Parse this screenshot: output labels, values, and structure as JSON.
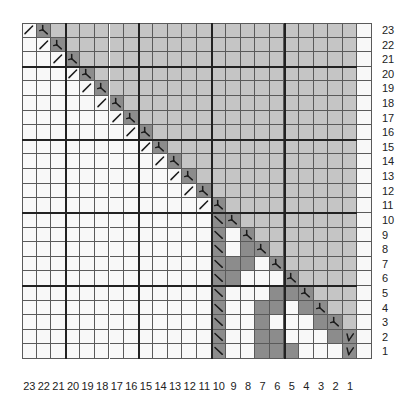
{
  "chart_data": {
    "type": "heatmap",
    "title": "",
    "rows": 23,
    "cols": 24,
    "row_labels": [
      "23",
      "22",
      "21",
      "20",
      "19",
      "18",
      "17",
      "16",
      "15",
      "14",
      "13",
      "12",
      "11",
      "10",
      "9",
      "8",
      "7",
      "6",
      "5",
      "4",
      "3",
      "2",
      "1"
    ],
    "col_labels": [
      "23",
      "22",
      "21",
      "20",
      "19",
      "18",
      "17",
      "16",
      "15",
      "14",
      "13",
      "12",
      "11",
      "10",
      "9",
      "8",
      "7",
      "6",
      "5",
      "4",
      "3",
      "2",
      "1",
      ""
    ],
    "colors": {
      "W": "#f8f8f8",
      "L": "#c5c5c5",
      "D": "#8c8c8c",
      "grid": "#5a5a5a",
      "thick": "#222222",
      "symbol": "#1a1a1a"
    },
    "legend": {
      "W": "white cell",
      "L": "light gray cell",
      "D": "dark gray cell",
      "/": "slash symbol",
      "\\": "backslash symbol",
      "Y": "inverted-Y (left-leaning decrease) symbol",
      "V": "V symbol"
    },
    "thick_lines": {
      "horizontal_after_row_index": [
        2,
        7,
        12,
        17
      ],
      "vertical_after_col_index": [
        2,
        7,
        12,
        17
      ]
    },
    "grid": [
      [
        "/",
        "Y",
        "L",
        "L",
        "L",
        "L",
        "L",
        "L",
        "L",
        "L",
        "L",
        "L",
        "L",
        "L",
        "L",
        "L",
        "L",
        "L",
        "L",
        "L",
        "L",
        "L",
        "L",
        "W"
      ],
      [
        "W",
        "/",
        "Y",
        "L",
        "L",
        "L",
        "L",
        "L",
        "L",
        "L",
        "L",
        "L",
        "L",
        "L",
        "L",
        "L",
        "L",
        "L",
        "L",
        "L",
        "L",
        "L",
        "L",
        "W"
      ],
      [
        "W",
        "W",
        "/",
        "Y",
        "L",
        "L",
        "L",
        "L",
        "L",
        "L",
        "L",
        "L",
        "L",
        "L",
        "L",
        "L",
        "L",
        "L",
        "L",
        "L",
        "L",
        "L",
        "L",
        "W"
      ],
      [
        "W",
        "W",
        "W",
        "/",
        "Y",
        "L",
        "L",
        "L",
        "L",
        "L",
        "L",
        "L",
        "L",
        "L",
        "L",
        "L",
        "L",
        "L",
        "L",
        "L",
        "L",
        "L",
        "L",
        "W"
      ],
      [
        "W",
        "W",
        "W",
        "W",
        "/",
        "Y",
        "L",
        "L",
        "L",
        "L",
        "L",
        "L",
        "L",
        "L",
        "L",
        "L",
        "L",
        "L",
        "L",
        "L",
        "L",
        "L",
        "L",
        "W"
      ],
      [
        "W",
        "W",
        "W",
        "W",
        "W",
        "/",
        "Y",
        "L",
        "L",
        "L",
        "L",
        "L",
        "L",
        "L",
        "L",
        "L",
        "L",
        "L",
        "L",
        "L",
        "L",
        "L",
        "L",
        "W"
      ],
      [
        "W",
        "W",
        "W",
        "W",
        "W",
        "W",
        "/",
        "Y",
        "L",
        "L",
        "L",
        "L",
        "L",
        "L",
        "L",
        "L",
        "L",
        "L",
        "L",
        "L",
        "L",
        "L",
        "L",
        "W"
      ],
      [
        "W",
        "W",
        "W",
        "W",
        "W",
        "W",
        "W",
        "/",
        "Y",
        "L",
        "L",
        "L",
        "L",
        "L",
        "L",
        "L",
        "L",
        "L",
        "L",
        "L",
        "L",
        "L",
        "L",
        "W"
      ],
      [
        "W",
        "W",
        "W",
        "W",
        "W",
        "W",
        "W",
        "W",
        "/",
        "Y",
        "L",
        "L",
        "L",
        "L",
        "L",
        "L",
        "L",
        "L",
        "L",
        "L",
        "L",
        "L",
        "L",
        "W"
      ],
      [
        "W",
        "W",
        "W",
        "W",
        "W",
        "W",
        "W",
        "W",
        "W",
        "/",
        "Y",
        "L",
        "L",
        "L",
        "L",
        "L",
        "L",
        "L",
        "L",
        "L",
        "L",
        "L",
        "L",
        "W"
      ],
      [
        "W",
        "W",
        "W",
        "W",
        "W",
        "W",
        "W",
        "W",
        "W",
        "W",
        "/",
        "Y",
        "L",
        "L",
        "L",
        "L",
        "L",
        "L",
        "L",
        "L",
        "L",
        "L",
        "L",
        "W"
      ],
      [
        "W",
        "W",
        "W",
        "W",
        "W",
        "W",
        "W",
        "W",
        "W",
        "W",
        "W",
        "/",
        "Y",
        "L",
        "L",
        "L",
        "L",
        "L",
        "L",
        "L",
        "L",
        "L",
        "L",
        "W"
      ],
      [
        "W",
        "W",
        "W",
        "W",
        "W",
        "W",
        "W",
        "W",
        "W",
        "W",
        "W",
        "W",
        "/",
        "Y",
        "L",
        "L",
        "L",
        "L",
        "L",
        "L",
        "L",
        "L",
        "L",
        "W"
      ],
      [
        "W",
        "W",
        "W",
        "W",
        "W",
        "W",
        "W",
        "W",
        "W",
        "W",
        "W",
        "W",
        "W",
        "\\",
        "Y",
        "L",
        "L",
        "L",
        "L",
        "L",
        "L",
        "L",
        "L",
        "W"
      ],
      [
        "W",
        "W",
        "W",
        "W",
        "W",
        "W",
        "W",
        "W",
        "W",
        "W",
        "W",
        "W",
        "W",
        "\\",
        "W",
        "Y",
        "L",
        "L",
        "L",
        "L",
        "L",
        "L",
        "L",
        "W"
      ],
      [
        "W",
        "W",
        "W",
        "W",
        "W",
        "W",
        "W",
        "W",
        "W",
        "W",
        "W",
        "W",
        "W",
        "\\",
        "W",
        "D",
        "Y",
        "L",
        "L",
        "L",
        "L",
        "L",
        "L",
        "W"
      ],
      [
        "W",
        "W",
        "W",
        "W",
        "W",
        "W",
        "W",
        "W",
        "W",
        "W",
        "W",
        "W",
        "W",
        "\\",
        "D",
        "D",
        "W",
        "Y",
        "L",
        "L",
        "L",
        "L",
        "L",
        "W"
      ],
      [
        "W",
        "W",
        "W",
        "W",
        "W",
        "W",
        "W",
        "W",
        "W",
        "W",
        "W",
        "W",
        "W",
        "\\",
        "D",
        "W",
        "W",
        "W",
        "Y",
        "L",
        "L",
        "L",
        "L",
        "W"
      ],
      [
        "W",
        "W",
        "W",
        "W",
        "W",
        "W",
        "W",
        "W",
        "W",
        "W",
        "W",
        "W",
        "W",
        "\\",
        "W",
        "W",
        "W",
        "D",
        "D",
        "Y",
        "L",
        "L",
        "L",
        "W"
      ],
      [
        "W",
        "W",
        "W",
        "W",
        "W",
        "W",
        "W",
        "W",
        "W",
        "W",
        "W",
        "W",
        "W",
        "\\",
        "W",
        "W",
        "D",
        "D",
        "W",
        "D",
        "Y",
        "L",
        "L",
        "W"
      ],
      [
        "W",
        "W",
        "W",
        "W",
        "W",
        "W",
        "W",
        "W",
        "W",
        "W",
        "W",
        "W",
        "W",
        "\\",
        "W",
        "W",
        "D",
        "W",
        "W",
        "W",
        "D",
        "Y",
        "L",
        "W"
      ],
      [
        "W",
        "W",
        "W",
        "W",
        "W",
        "W",
        "W",
        "W",
        "W",
        "W",
        "W",
        "W",
        "W",
        "\\",
        "W",
        "W",
        "D",
        "D",
        "W",
        "W",
        "W",
        "D",
        "V",
        "W"
      ],
      [
        "W",
        "W",
        "W",
        "W",
        "W",
        "W",
        "W",
        "W",
        "W",
        "W",
        "W",
        "W",
        "W",
        "\\",
        "W",
        "W",
        "D",
        "D",
        "D",
        "W",
        "W",
        "W",
        "V",
        "W"
      ]
    ]
  }
}
